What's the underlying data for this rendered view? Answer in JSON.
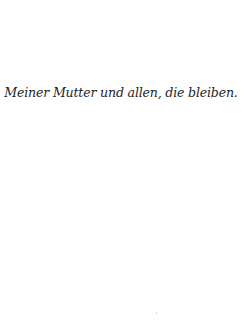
{
  "page": {
    "dedication": "Meiner Mutter und allen, die bleiben."
  }
}
